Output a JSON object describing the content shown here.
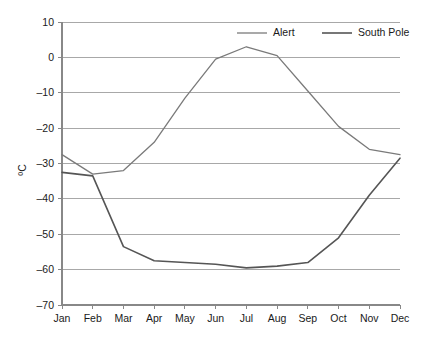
{
  "chart_data": {
    "type": "line",
    "title": "",
    "xlabel": "",
    "ylabel": "ºC",
    "categories": [
      "Jan",
      "Feb",
      "Mar",
      "Apr",
      "May",
      "Jun",
      "Jul",
      "Aug",
      "Sep",
      "Oct",
      "Nov",
      "Dec"
    ],
    "ylim": [
      -70,
      10
    ],
    "yticks": [
      10,
      0,
      -10,
      -20,
      -30,
      -40,
      -50,
      -60,
      -70
    ],
    "ytick_labels": [
      "10",
      "0",
      "–10",
      "–20",
      "–30",
      "–40",
      "–50",
      "–60",
      "–70"
    ],
    "grid": true,
    "legend_position": "top-right",
    "series": [
      {
        "name": "Alert",
        "color": "#7a7a7a",
        "width": 1.3,
        "values": [
          -27.5,
          -33.0,
          -32.0,
          -24.0,
          -11.5,
          -0.5,
          3.0,
          0.5,
          -9.5,
          -19.5,
          -26.0,
          -27.5
        ]
      },
      {
        "name": "South Pole",
        "color": "#555555",
        "width": 1.6,
        "values": [
          -32.5,
          -33.5,
          -53.5,
          -57.5,
          -58.0,
          -58.5,
          -59.5,
          -59.0,
          -58.0,
          -51.0,
          -39.0,
          -28.5
        ]
      }
    ]
  },
  "axis": {
    "line_color": "#888888",
    "grid_color": "#a8a8a8"
  }
}
